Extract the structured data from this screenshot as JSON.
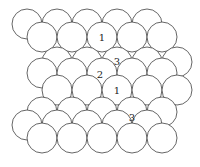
{
  "diagram": {
    "type": "close-packed-layers",
    "radius": 15,
    "colors": {
      "stroke": "#555555",
      "fill": "#ffffff",
      "text": "#222222"
    },
    "rows": [
      {
        "y": 24,
        "xs": [
          27,
          57,
          87,
          117,
          147
        ]
      },
      {
        "y": 37,
        "xs": [
          42,
          72,
          102,
          132,
          162
        ]
      },
      {
        "y": 62,
        "xs": [
          57,
          87,
          117,
          147,
          177
        ]
      },
      {
        "y": 73,
        "xs": [
          42,
          72,
          102,
          132,
          162
        ]
      },
      {
        "y": 90,
        "xs": [
          57,
          87,
          117,
          147,
          177
        ]
      },
      {
        "y": 112,
        "xs": [
          42,
          72,
          102,
          132,
          162
        ]
      },
      {
        "y": 125,
        "xs": [
          27,
          57,
          87,
          117,
          147
        ]
      },
      {
        "y": 138,
        "xs": [
          42,
          72,
          102,
          132,
          162
        ]
      }
    ],
    "labels": [
      {
        "text": "1",
        "x": 102,
        "y": 41
      },
      {
        "text": "3",
        "x": 117,
        "y": 65
      },
      {
        "text": "2",
        "x": 100,
        "y": 78
      },
      {
        "text": "1",
        "x": 117,
        "y": 94
      },
      {
        "text": "3",
        "x": 132,
        "y": 121
      }
    ]
  }
}
